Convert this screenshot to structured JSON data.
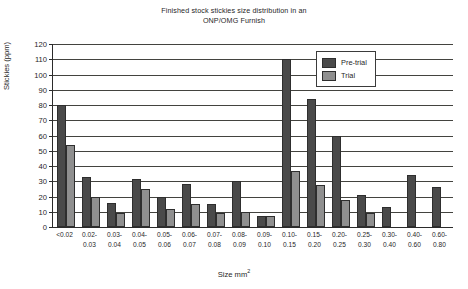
{
  "chart_data": {
    "type": "bar",
    "title": "Finished stock stickies size distribution in an ONP/OMG Furnish",
    "title_lines": [
      "Finished stock stickies size distribution in an",
      "ONP/OMG Furnish"
    ],
    "xlabel": "Size mm",
    "xlabel_sup": "2",
    "ylabel": "Stickies (ppm)",
    "ylim": [
      0,
      120
    ],
    "ytick_step": 10,
    "yticks": [
      0,
      10,
      20,
      30,
      40,
      50,
      60,
      70,
      80,
      90,
      100,
      110,
      120
    ],
    "grid": true,
    "legend_position": "top-right",
    "categories": [
      "<0.02",
      "0.02-0.03",
      "0.03-0.04",
      "0.04-0.05",
      "0.05-0.06",
      "0.06-0.07",
      "0.07-0.08",
      "0.08-0.09",
      "0.09-0.10",
      "0.10-0.15",
      "0.15-0.20",
      "0.20-0.25",
      "0.25-0.30",
      "0.30-0.40",
      "0.40-0.60",
      "0.60-0.80"
    ],
    "category_lines": [
      [
        "<0.02",
        ""
      ],
      [
        "0.02-",
        "0.03"
      ],
      [
        "0.03-",
        "0.04"
      ],
      [
        "0.04-",
        "0.05"
      ],
      [
        "0.05-",
        "0.06"
      ],
      [
        "0.06-",
        "0.07"
      ],
      [
        "0.07-",
        "0.08"
      ],
      [
        "0.08-",
        "0.09"
      ],
      [
        "0.09-",
        "0.10"
      ],
      [
        "0.10-",
        "0.15"
      ],
      [
        "0.15-",
        "0.20"
      ],
      [
        "0.20-",
        "0.25"
      ],
      [
        "0.25-",
        "0.30"
      ],
      [
        "0.30-",
        "0.40"
      ],
      [
        "0.40-",
        "0.60"
      ],
      [
        "0.60-",
        "0.80"
      ]
    ],
    "series": [
      {
        "name": "Pre-trial",
        "color": "#4a4a4a",
        "values": [
          80,
          32.5,
          15.5,
          31.5,
          19.5,
          28,
          15,
          30.5,
          7,
          110.5,
          84,
          60,
          21,
          13,
          34,
          26
        ]
      },
      {
        "name": "Trial",
        "color": "#8f8f8f",
        "values": [
          53.5,
          20,
          9.5,
          25,
          11.5,
          15,
          9.5,
          10,
          7,
          37,
          27.5,
          17.5,
          9.5,
          0,
          0,
          0
        ]
      }
    ]
  },
  "legend": {
    "items": [
      {
        "label": "Pre-trial",
        "color": "#4a4a4a"
      },
      {
        "label": "Trial",
        "color": "#8f8f8f"
      }
    ]
  }
}
